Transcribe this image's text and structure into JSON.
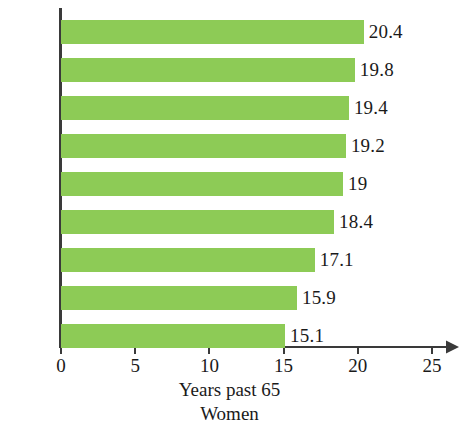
{
  "chart_data": {
    "type": "bar",
    "orientation": "horizontal",
    "title": "",
    "xlabel": "Years past 65",
    "sublabel": "Women",
    "ylabel": "",
    "categories": [
      "2030",
      "2020",
      "2010",
      "2000",
      "1990",
      "1980",
      "1970",
      "1960",
      "1950"
    ],
    "values": [
      20.4,
      19.8,
      19.4,
      19.2,
      19,
      18.4,
      17.1,
      15.9,
      15.1
    ],
    "value_labels": [
      "20.4",
      "19.8",
      "19.4",
      "19.2",
      "19",
      "18.4",
      "17.1",
      "15.9",
      "15.1"
    ],
    "xlim": [
      0,
      25
    ],
    "xticks": [
      0,
      5,
      10,
      15,
      20,
      25
    ],
    "xtick_labels": [
      "0",
      "5",
      "10",
      "15",
      "20",
      "25"
    ],
    "grid": false,
    "legend": null,
    "bar_color": "#8DCB56",
    "axis_color": "#3a3a3a",
    "text_color": "#1a1a1a",
    "background": "#ffffff"
  },
  "axis": {
    "x_caption_line1": "Years past 65",
    "x_caption_line2": "Women"
  }
}
